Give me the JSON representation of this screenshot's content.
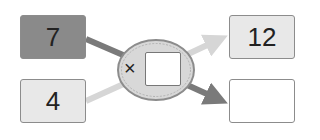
{
  "diagram": {
    "inputs": [
      {
        "value": "7",
        "fill": "#8a8a8a"
      },
      {
        "value": "4",
        "fill": "#e8e8e8"
      }
    ],
    "operator": {
      "symbol": "×",
      "blank_value": ""
    },
    "outputs": [
      {
        "value": "12",
        "fill": "#e8e8e8"
      },
      {
        "value": "",
        "fill": "#ffffff"
      }
    ],
    "colors": {
      "dark_arrow": "#7a7a7a",
      "light_arrow": "#d6d6d6",
      "ellipse_fill": "#d8d8d8",
      "ellipse_stroke": "#8c8c8c"
    }
  }
}
